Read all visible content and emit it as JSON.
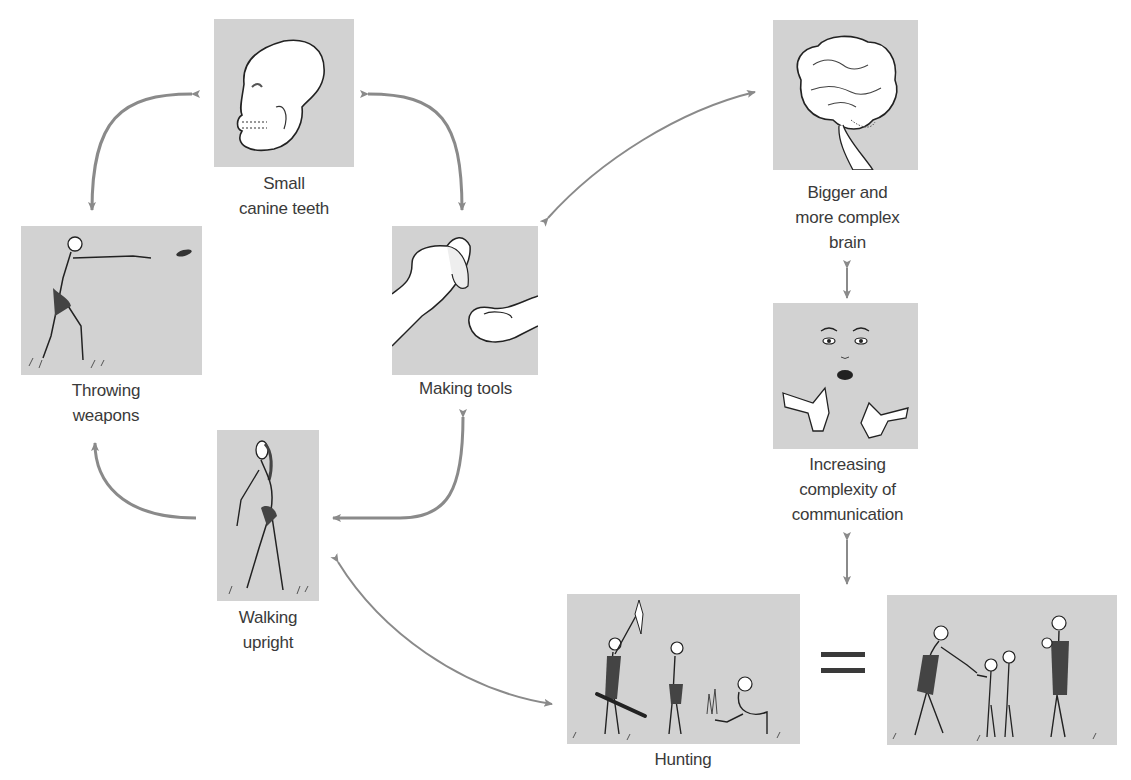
{
  "colors": {
    "panel_bg": "#d2d2d2",
    "arrow": "#8a8a8a",
    "text": "#3a3a3a",
    "background": "#ffffff"
  },
  "nodes": {
    "teeth": {
      "label_lines": [
        "Small",
        "canine teeth"
      ],
      "icon": "skull-icon"
    },
    "throwing": {
      "label_lines": [
        "Throwing",
        "weapons"
      ],
      "icon": "throwing-figure-icon"
    },
    "tools": {
      "label_lines": [
        "Making tools"
      ],
      "icon": "hands-with-stone-icon"
    },
    "walking": {
      "label_lines": [
        "Walking",
        "upright"
      ],
      "icon": "walking-figure-icon"
    },
    "brain": {
      "label_lines": [
        "Bigger and",
        "more complex",
        "brain"
      ],
      "icon": "brain-icon"
    },
    "communication": {
      "label_lines": [
        "Increasing",
        "complexity of",
        "communication"
      ],
      "icon": "face-and-hands-icon"
    },
    "hunting": {
      "label_lines": [
        "Hunting"
      ],
      "icon": "hunting-group-icon"
    },
    "family": {
      "label_lines": [],
      "icon": "family-group-icon"
    }
  },
  "equals_symbol": "=",
  "edges": [
    {
      "from": "teeth",
      "to": "throwing",
      "type": "bidirectional"
    },
    {
      "from": "teeth",
      "to": "tools",
      "type": "bidirectional"
    },
    {
      "from": "walking",
      "to": "throwing",
      "type": "directed"
    },
    {
      "from": "tools",
      "to": "walking",
      "type": "bidirectional"
    },
    {
      "from": "tools",
      "to": "brain",
      "type": "bidirectional"
    },
    {
      "from": "brain",
      "to": "communication",
      "type": "bidirectional"
    },
    {
      "from": "communication",
      "to": "hunting",
      "type": "bidirectional"
    },
    {
      "from": "walking",
      "to": "hunting",
      "type": "bidirectional"
    },
    {
      "from": "hunting",
      "to": "family",
      "type": "equals"
    }
  ]
}
